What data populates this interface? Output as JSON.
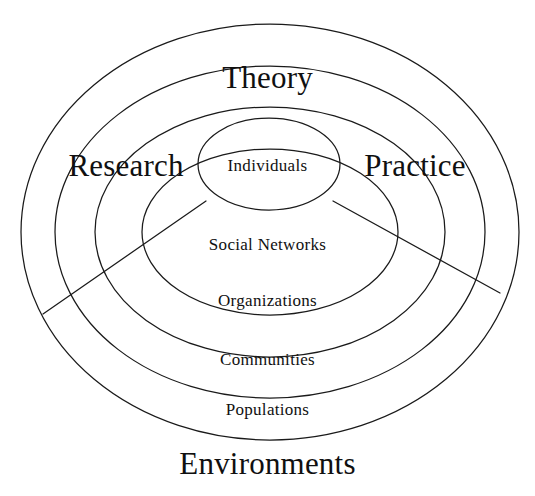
{
  "figure": {
    "background_color": "#ffffff",
    "stroke_color": "#1a1a1a"
  },
  "rings": [
    {
      "id": "individuals",
      "label": "Individuals",
      "level": 1
    },
    {
      "id": "social-networks",
      "label": "Social Networks",
      "level": 2
    },
    {
      "id": "organizations",
      "label": "Organizations",
      "level": 3
    },
    {
      "id": "communities",
      "label": "Communities",
      "level": 4
    },
    {
      "id": "populations",
      "label": "Populations",
      "level": 5
    }
  ],
  "sectors": [
    {
      "id": "theory",
      "label": "Theory",
      "position": "top"
    },
    {
      "id": "research",
      "label": "Research",
      "position": "left"
    },
    {
      "id": "practice",
      "label": "Practice",
      "position": "right"
    }
  ],
  "caption": {
    "label": "Environments",
    "position": "bottom"
  }
}
